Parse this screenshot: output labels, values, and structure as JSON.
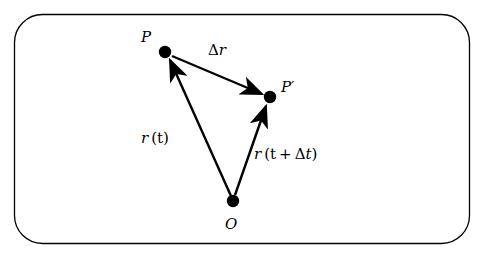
{
  "figure": {
    "frame": {
      "shape": "rounded-rectangle",
      "stroke_color": "#000000"
    },
    "background_color": "#ffffff",
    "points": [
      {
        "id": "P",
        "label": "P",
        "x": 165,
        "y": 52
      },
      {
        "id": "Pprime",
        "label": "P′",
        "x": 270,
        "y": 97
      },
      {
        "id": "O",
        "label": "O",
        "x": 233,
        "y": 201
      }
    ],
    "vectors": [
      {
        "id": "r-t",
        "from": "O",
        "to": "P",
        "label_plain": "r (t)"
      },
      {
        "id": "r-t-plus-dt",
        "from": "O",
        "to": "Pprime",
        "label_plain": "r (t + Δt)"
      },
      {
        "id": "delta-r",
        "from": "P",
        "to": "Pprime",
        "label_plain": "Δr"
      }
    ],
    "labels": {
      "P": "P",
      "P_prime_base": "P",
      "P_prime_mark": "′",
      "O": "O",
      "delta_r_delta": "Δ",
      "delta_r_var": "r",
      "r_t_var": "r",
      "r_t_arg": "(t)",
      "r_tdt_var": "r",
      "r_tdt_arg_open": "(t",
      "r_tdt_plus": "+",
      "r_tdt_delta": "Δ",
      "r_tdt_t": "t",
      "r_tdt_close": ")"
    }
  }
}
